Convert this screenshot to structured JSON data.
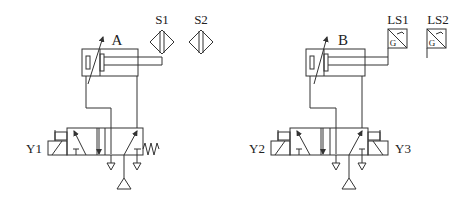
{
  "diagram": {
    "type": "pneumatic-circuit",
    "colors": {
      "line": "#333333",
      "background": "#ffffff"
    },
    "circuits": [
      {
        "cylinder_label": "A",
        "sensors": [
          {
            "label": "S1",
            "type": "proximity-sensor"
          },
          {
            "label": "S2",
            "type": "proximity-sensor"
          }
        ],
        "valve": {
          "type": "5/3-way solenoid valve, single solenoid with spring return",
          "solenoids": [
            "Y1"
          ]
        }
      },
      {
        "cylinder_label": "B",
        "sensors": [
          {
            "label": "LS1",
            "type": "limit-switch",
            "symbol_letter": "G"
          },
          {
            "label": "LS2",
            "type": "limit-switch",
            "symbol_letter": "G"
          }
        ],
        "valve": {
          "type": "5/3-way solenoid valve, double solenoid",
          "solenoids": [
            "Y2",
            "Y3"
          ]
        }
      }
    ]
  }
}
